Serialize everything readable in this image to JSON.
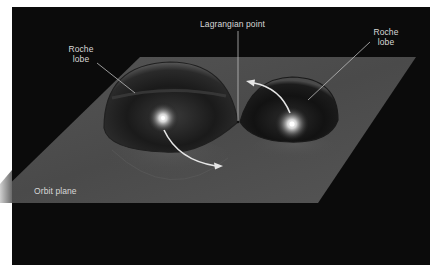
{
  "figure": {
    "colors": {
      "background_page": "#ffffff",
      "panel": "#0b0b0b",
      "plane": "#4c4c4c",
      "lobe_edge": "#1a1a1a",
      "star_glow": "#ffffff",
      "arrow": "#e6e6e6",
      "label_text": "#d8d8d8",
      "pointer_line": "#bdbdbd"
    },
    "labels": {
      "left_lobe": "Roche lobe",
      "right_lobe": "Roche lobe",
      "lagrangian_point": "Lagrangian point",
      "orbit_plane": "Orbit plane"
    },
    "elements": {
      "left_star": {
        "cx": 163,
        "cy": 118
      },
      "right_star": {
        "cx": 292,
        "cy": 124
      },
      "lagrangian_point": {
        "x": 238,
        "y": 122
      }
    }
  }
}
